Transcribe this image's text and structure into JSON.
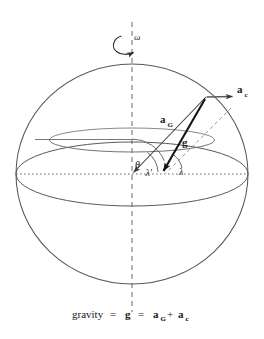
{
  "figure": {
    "background_color": "#ffffff",
    "stroke_color": "#4a4a4a",
    "bold_stroke_color": "#1a1a1a",
    "labels": {
      "omega": "ω",
      "a_c_symbol": "a",
      "a_c_subscript": "c",
      "a_G_symbol": "a",
      "a_G_subscript": "G",
      "g_symbol": "g",
      "theta": "θ",
      "lambda_prime": "λ'",
      "lambda": "λ"
    },
    "caption": {
      "word_gravity": "gravity",
      "equals_1": "=",
      "g": "g",
      "equals_2": "=",
      "a1": "a",
      "a1_sub": "G",
      "plus": "+",
      "a2": "a",
      "a2_sub": "c",
      "full_text": "gravity = g = a_G + a_c"
    },
    "geometry": {
      "sphere_center_x": 132,
      "sphere_center_y": 174,
      "sphere_radius_x": 116,
      "sphere_radius_y": 110,
      "surface_point_x": 206,
      "surface_point_y": 97,
      "equator_ellipse_ry": 32,
      "latitude_ellipse_ry": 12,
      "axis_top_y": 22,
      "axis_bottom_y": 310
    }
  }
}
